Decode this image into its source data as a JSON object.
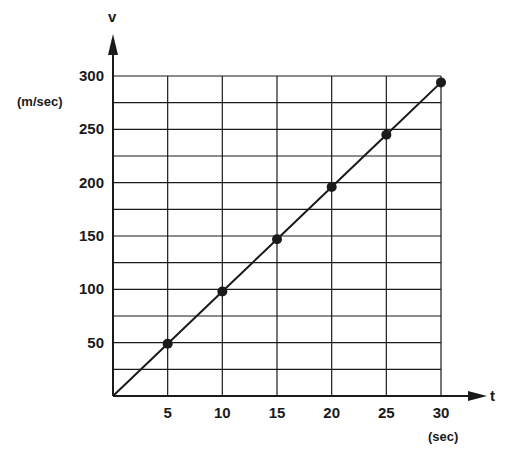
{
  "chart_data": {
    "type": "line",
    "title": "",
    "xlabel": "t",
    "xunit": "(sec)",
    "ylabel": "v",
    "yunit": "(m/sec)",
    "xlim": [
      0,
      30
    ],
    "ylim": [
      0,
      300
    ],
    "x_ticks": [
      5,
      10,
      15,
      20,
      25,
      30
    ],
    "y_ticks": [
      50,
      100,
      150,
      200,
      250,
      300
    ],
    "y_minor_step": 25,
    "grid": true,
    "legend": null,
    "series": [
      {
        "name": "v",
        "x": [
          0,
          5,
          10,
          15,
          20,
          25,
          30
        ],
        "y": [
          0,
          49,
          98,
          147,
          196,
          245,
          294
        ],
        "markers_at": [
          5,
          10,
          15,
          20,
          25,
          30
        ]
      }
    ]
  },
  "colors": {
    "ink": "#1a1a1a",
    "background": "#ffffff"
  }
}
